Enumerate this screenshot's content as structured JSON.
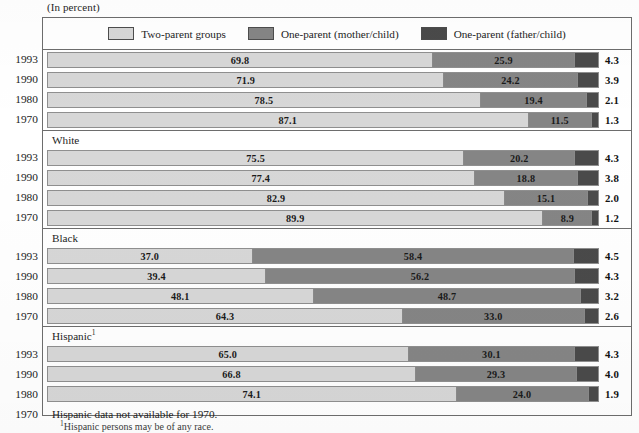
{
  "unit_label": "(In percent)",
  "colors": {
    "two_parent": "#d7d7d7",
    "one_parent_mother": "#858585",
    "one_parent_father": "#4a4a4a",
    "frame": "#6d6d6d",
    "text": "#1a1a1a"
  },
  "legend": {
    "items": [
      {
        "label": "Two-parent groups",
        "color": "#d7d7d7",
        "icon": "legend-swatch-light"
      },
      {
        "label": "One-parent (mother/child)",
        "color": "#858585",
        "icon": "legend-swatch-medium"
      },
      {
        "label": "One-parent (father/child)",
        "color": "#4a4a4a",
        "icon": "legend-swatch-dark"
      }
    ]
  },
  "footnote": {
    "marker": "1",
    "text": "Hispanic persons may be of any race."
  },
  "chart_data": {
    "type": "bar",
    "subtype": "stacked-horizontal-100pct",
    "title": "",
    "subtitle": "(In percent)",
    "xlabel": "",
    "ylabel": "",
    "xlim": [
      0,
      100
    ],
    "grid": false,
    "legend_position": "top-center",
    "series": [
      {
        "name": "Two-parent groups",
        "color": "#d7d7d7"
      },
      {
        "name": "One-parent (mother/child)",
        "color": "#858585"
      },
      {
        "name": "One-parent (father/child)",
        "color": "#4a4a4a"
      }
    ],
    "groups": [
      {
        "title": "",
        "rows": [
          {
            "year": "1993",
            "values": [
              69.8,
              25.9,
              4.3
            ],
            "labels": [
              "69.8",
              "25.9",
              "4.3"
            ]
          },
          {
            "year": "1990",
            "values": [
              71.9,
              24.2,
              3.9
            ],
            "labels": [
              "71.9",
              "24.2",
              "3.9"
            ]
          },
          {
            "year": "1980",
            "values": [
              78.5,
              19.4,
              2.1
            ],
            "labels": [
              "78.5",
              "19.4",
              "2.1"
            ]
          },
          {
            "year": "1970",
            "values": [
              87.1,
              11.5,
              1.3
            ],
            "labels": [
              "87.1",
              "11.5",
              "1.3"
            ]
          }
        ]
      },
      {
        "title": "White",
        "rows": [
          {
            "year": "1993",
            "values": [
              75.5,
              20.2,
              4.3
            ],
            "labels": [
              "75.5",
              "20.2",
              "4.3"
            ]
          },
          {
            "year": "1990",
            "values": [
              77.4,
              18.8,
              3.8
            ],
            "labels": [
              "77.4",
              "18.8",
              "3.8"
            ]
          },
          {
            "year": "1980",
            "values": [
              82.9,
              15.1,
              2.0
            ],
            "labels": [
              "82.9",
              "15.1",
              "2.0"
            ]
          },
          {
            "year": "1970",
            "values": [
              89.9,
              8.9,
              1.2
            ],
            "labels": [
              "89.9",
              "8.9",
              "1.2"
            ]
          }
        ]
      },
      {
        "title": "Black",
        "rows": [
          {
            "year": "1993",
            "values": [
              37.0,
              58.4,
              4.5
            ],
            "labels": [
              "37.0",
              "58.4",
              "4.5"
            ]
          },
          {
            "year": "1990",
            "values": [
              39.4,
              56.2,
              4.3
            ],
            "labels": [
              "39.4",
              "56.2",
              "4.3"
            ]
          },
          {
            "year": "1980",
            "values": [
              48.1,
              48.7,
              3.2
            ],
            "labels": [
              "48.1",
              "48.7",
              "3.2"
            ]
          },
          {
            "year": "1970",
            "values": [
              64.3,
              33.0,
              2.6
            ],
            "labels": [
              "64.3",
              "33.0",
              "2.6"
            ]
          }
        ]
      },
      {
        "title": "Hispanic",
        "title_superscript": "1",
        "rows": [
          {
            "year": "1993",
            "values": [
              65.0,
              30.1,
              4.3
            ],
            "labels": [
              "65.0",
              "30.1",
              "4.3"
            ]
          },
          {
            "year": "1990",
            "values": [
              66.8,
              29.3,
              4.0
            ],
            "labels": [
              "66.8",
              "29.3",
              "4.0"
            ]
          },
          {
            "year": "1980",
            "values": [
              74.1,
              24.0,
              1.9
            ],
            "labels": [
              "74.1",
              "24.0",
              "1.9"
            ]
          }
        ],
        "note_row": {
          "year": "1970",
          "text": "Hispanic data not available for 1970."
        }
      }
    ]
  }
}
